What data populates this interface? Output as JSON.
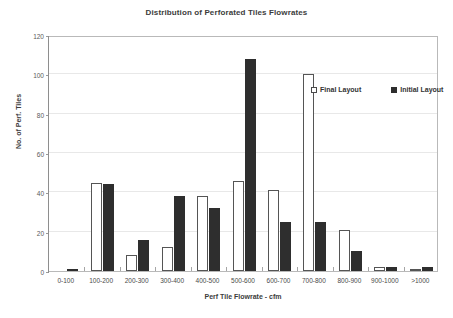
{
  "chart_data": {
    "type": "bar",
    "title": "Distribution of Perforated Tiles Flowrates",
    "xlabel": "Perf Tile Flowrate - cfm",
    "ylabel": "No. of Perf. Tiles",
    "categories": [
      "0-100",
      "100-200",
      "200-300",
      "300-400",
      "400-500",
      "500-600",
      "600-700",
      "700-800",
      "800-900",
      "900-1000",
      ">1000"
    ],
    "series": [
      {
        "name": "Final Layout",
        "color": "#ffffff",
        "edge_color": "#555555",
        "values": [
          0,
          45,
          8,
          12,
          38,
          46,
          41,
          100,
          21,
          2,
          1
        ]
      },
      {
        "name": "Initial Layout",
        "color": "#2e2e2e",
        "edge_color": "#2e2e2e",
        "values": [
          1,
          44,
          16,
          38,
          32,
          108,
          25,
          25,
          10,
          2,
          2
        ]
      }
    ],
    "ylim": [
      0,
      120
    ],
    "yticks": [
      0,
      20,
      40,
      60,
      80,
      100,
      120
    ],
    "ytick_labels": [
      "0",
      "20",
      "40",
      "60",
      "80",
      "100",
      "120"
    ],
    "grid": "horizontal",
    "legend_position": "top-right-inside"
  },
  "legend": {
    "entries": [
      {
        "label": "Final Layout",
        "swatch": "hollow-square"
      },
      {
        "label": "Initial Layout",
        "swatch": "filled-square"
      }
    ]
  }
}
